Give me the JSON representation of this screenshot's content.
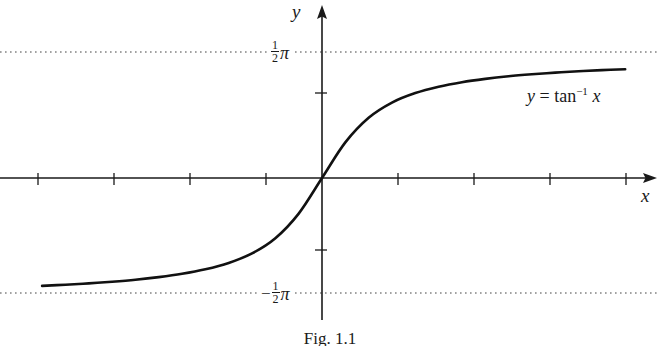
{
  "figure": {
    "caption": "Fig. 1.1",
    "background_color": "#ffffff",
    "ink_color": "#1a1a1a"
  },
  "chart_data": {
    "type": "line",
    "title": "",
    "subtitle": "",
    "xlabel": "x",
    "ylabel": "y",
    "annotations": [
      {
        "name": "curve-equation",
        "text_plain": "y = tan^-1 x",
        "y_var": "y",
        "equals": "=",
        "fn": "tan",
        "exponent": "−1",
        "x_var": "x",
        "position": "upper-right, along curve"
      }
    ],
    "series": [
      {
        "name": "y = tan^-1 x",
        "kind": "curve",
        "x": [
          -6.0,
          -5.5,
          -5.0,
          -4.5,
          -4.0,
          -3.5,
          -3.0,
          -2.5,
          -2.0,
          -1.5,
          -1.0,
          -0.5,
          0.0,
          0.5,
          1.0,
          1.5,
          2.0,
          2.5,
          3.0,
          3.5,
          4.0,
          4.5,
          5.0,
          5.5,
          6.0,
          6.5
        ],
        "y": [
          -1.406,
          -1.391,
          -1.373,
          -1.352,
          -1.326,
          -1.292,
          -1.249,
          -1.19,
          -1.107,
          -0.983,
          -0.785,
          -0.464,
          0.0,
          0.464,
          0.785,
          0.983,
          1.107,
          1.19,
          1.249,
          1.292,
          1.326,
          1.352,
          1.373,
          1.391,
          1.406,
          1.418
        ]
      }
    ],
    "asymptotes": [
      {
        "name": "upper-asymptote",
        "orientation": "horizontal",
        "value": 1.5708,
        "label_plain": "1/2 pi",
        "label_numerator": "1",
        "label_denominator": "2",
        "label_symbol": "π",
        "label_sign": "",
        "style": "dotted"
      },
      {
        "name": "lower-asymptote",
        "orientation": "horizontal",
        "value": -1.5708,
        "label_plain": "-1/2 pi",
        "label_numerator": "1",
        "label_denominator": "2",
        "label_symbol": "π",
        "label_sign": "−",
        "style": "dotted"
      }
    ],
    "xlim": [
      -6.8,
      7.35
    ],
    "ylim": [
      -2.12,
      2.12
    ],
    "grid": false,
    "legend": false,
    "axes": {
      "x_axis": {
        "arrow": true,
        "ticks_count": 8,
        "tick_spacing_units": 1.65
      },
      "y_axis": {
        "arrow": true,
        "ticks_count": 2,
        "tick_values": [
          1.0,
          -1.0
        ]
      }
    }
  }
}
